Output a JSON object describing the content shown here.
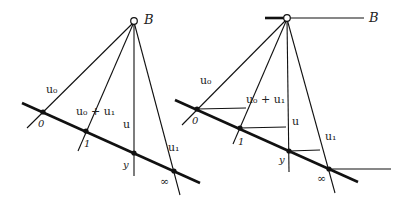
{
  "diagrams": [
    {
      "id": "left",
      "apex_label": "B",
      "ray_labels": {
        "u0": "u₀",
        "u0_plus_u1": "u₀ + u₁",
        "u": "u",
        "u1": "u₁"
      },
      "point_labels": {
        "zero": "0",
        "one": "1",
        "y": "y",
        "infinity": "∞"
      }
    },
    {
      "id": "right",
      "apex_label": "B",
      "ray_labels": {
        "u0": "u₀",
        "u0_plus_u1": "u₀ + u₁",
        "u": "u",
        "u1": "u₁"
      },
      "point_labels": {
        "zero": "0",
        "one": "1",
        "y": "y",
        "infinity": "∞"
      }
    }
  ],
  "colors": {
    "ink": "#111111",
    "background": "#ffffff"
  }
}
